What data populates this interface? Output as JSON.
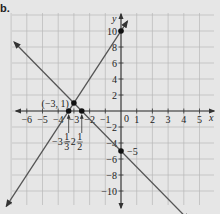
{
  "part_label": "b.",
  "chart_data": {
    "type": "line",
    "title": "",
    "xlabel": "x",
    "ylabel": "y",
    "xlim": [
      -7,
      6
    ],
    "ylim": [
      -12,
      12
    ],
    "grid": true,
    "x_ticks": [
      -6,
      -5,
      -4,
      -3,
      -2,
      -1,
      1,
      2,
      3,
      4,
      5
    ],
    "x_tick_labels": [
      "-6",
      "-5",
      "-4",
      "-3",
      "-2",
      "-1",
      "1",
      "2",
      "3",
      "4",
      "5"
    ],
    "y_ticks": [
      10,
      8,
      6,
      4,
      2,
      -2,
      -4,
      -6,
      -8,
      -10
    ],
    "y_tick_labels": [
      "10",
      "8",
      "6",
      "4",
      "2",
      "-2",
      "-4",
      "-6",
      "-8",
      "-10"
    ],
    "origin_label": "0",
    "series": [
      {
        "name": "line 1 (y = 3x + 10)",
        "slope": 3,
        "intercept": 10,
        "x": [
          -7.3,
          0.4
        ],
        "y": [
          -11.9,
          11.2
        ]
      },
      {
        "name": "line 2 (y = -2x - 5)",
        "slope": -2,
        "intercept": -5,
        "x": [
          -6.8,
          4.3
        ],
        "y": [
          8.6,
          -13.6
        ]
      }
    ],
    "points": [
      {
        "x": -3,
        "y": 1,
        "label": "(-3, 1)"
      },
      {
        "x": 0,
        "y": 10,
        "label": ""
      },
      {
        "x": 0,
        "y": -5,
        "label": "-5"
      },
      {
        "x": -3.3333,
        "y": 0,
        "label": "-3 1/3"
      },
      {
        "x": -2.5,
        "y": 0,
        "label": "-2 1/2"
      }
    ],
    "annotations": [
      {
        "text": "(-3, 1)",
        "target": [
          -3,
          1
        ]
      },
      {
        "text": "-3 1/3",
        "target": [
          -3.3333,
          0
        ],
        "type": "arrow-label"
      },
      {
        "text": "-2 1/2",
        "target": [
          -2.5,
          0
        ],
        "type": "arrow-label"
      },
      {
        "text": "-5",
        "target": [
          0,
          -5
        ]
      }
    ],
    "colors": {
      "grid": "#b8b8b8",
      "axis": "#333333",
      "line": "#555555",
      "point": "#111111",
      "background": "#e6e6e6"
    }
  }
}
